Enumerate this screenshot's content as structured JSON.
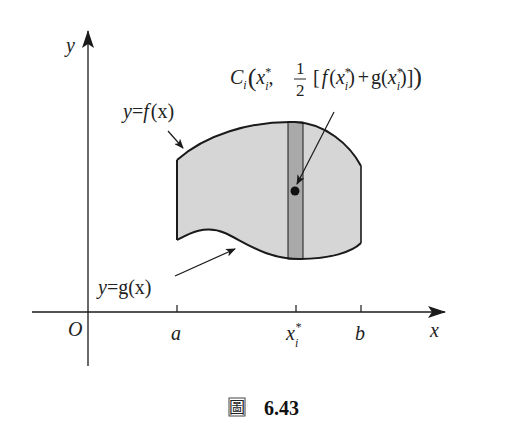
{
  "figure": {
    "axes": {
      "x_label": "x",
      "y_label": "y",
      "origin_label": "O"
    },
    "ticks": {
      "a": "a",
      "xi": "x",
      "xi_sub": "i",
      "xi_sup": "*",
      "b": "b"
    },
    "curves": {
      "f_label_y": "y",
      "f_label_eq": "=",
      "f_label_fn": "f",
      "f_label_arg": "(x)",
      "g_label_y": "y",
      "g_label_eq": "=",
      "g_label_fn": "g(x)"
    },
    "point_label": {
      "name": "C",
      "name_sub": "i",
      "open": "(",
      "x": "x",
      "x_sub": "i",
      "x_sup": "*",
      "comma": ",",
      "frac_num": "1",
      "frac_den": "2",
      "bracket_open": "[",
      "f": "f",
      "f_arg_open": "(",
      "f_arg_x": "x",
      "f_arg_sub": "i",
      "f_arg_sup": "*",
      "f_arg_close": ")",
      "plus": "+",
      "g": "g(",
      "g_arg_x": "x",
      "g_arg_sub": "i",
      "g_arg_sup": "*",
      "g_arg_close": ")",
      "bracket_close": "]",
      "close": ")"
    },
    "colors": {
      "region_fill": "#d6d6d6",
      "strip_fill": "#a9a9a9",
      "stroke": "#1a1a1a"
    }
  },
  "caption": {
    "char": "圖",
    "number": "6.43"
  }
}
